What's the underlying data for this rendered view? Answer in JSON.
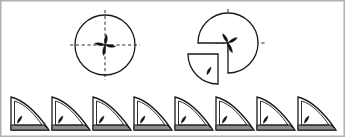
{
  "figure": {
    "canvas": {
      "width": 345,
      "height": 137
    },
    "background_color": "#ffffff",
    "border_color": "#b0b0b0",
    "outline_color": "#1a1a1a",
    "axis_color": "#2b2b2b",
    "petal_fill": "#111111",
    "base_fill": "#8c8c8c",
    "wedge_fill": "#ffffff"
  },
  "top_row": {
    "label": "top-row",
    "shape_count": 2,
    "shapes": [
      {
        "name": "full-circle-with-axes",
        "kind": "circle",
        "cx": 105,
        "cy": 45,
        "r": 30,
        "axes": "dashed-crosshair",
        "petal_count": 4,
        "petal_directions": [
          "up",
          "right",
          "down",
          "left"
        ],
        "detached_quarter": false
      },
      {
        "name": "circle-with-detached-quarter",
        "kind": "circle-quarter-exploded",
        "cx": 228,
        "cy": 43,
        "r": 30,
        "axes": "dashed-crosshair",
        "petal_count": 3,
        "petal_directions": [
          "up-left",
          "up-right",
          "down-right"
        ],
        "detached_quarter": true,
        "detached_quadrant": "bottom-left",
        "detach_offset_x": -10,
        "detach_offset_y": 11,
        "detached_petal_count": 1
      }
    ]
  },
  "bottom_row": {
    "label": "wedge-strip",
    "shape_count": 8,
    "wedge": {
      "name": "quarter-wedge",
      "width": 38,
      "height": 33,
      "start_x": 11,
      "baseline_y": 130,
      "pitch": 41,
      "base_strip_height": 5,
      "inner_offset": 4,
      "petal_count": 1
    },
    "items": [
      {
        "index": 1,
        "x": 11
      },
      {
        "index": 2,
        "x": 52
      },
      {
        "index": 3,
        "x": 93
      },
      {
        "index": 4,
        "x": 134
      },
      {
        "index": 5,
        "x": 175
      },
      {
        "index": 6,
        "x": 216
      },
      {
        "index": 7,
        "x": 257
      },
      {
        "index": 8,
        "x": 298
      }
    ]
  }
}
